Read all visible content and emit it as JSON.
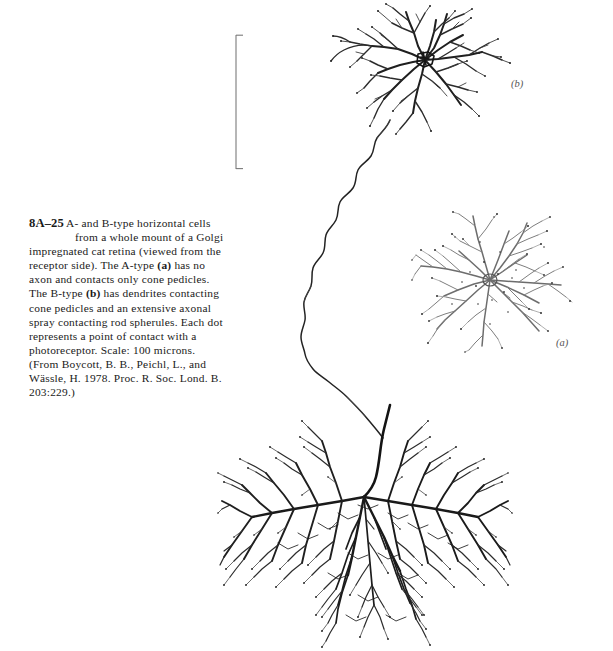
{
  "figure": {
    "number": "8A–25",
    "caption_line1": "A- and B-type horizontal cells",
    "caption_line2": "from a whole mount of a Golgi",
    "caption_rest_1": "impregnated cat retina (viewed from the receptor side). The A-type ",
    "caption_bold_a": "(a)",
    "caption_rest_2": " has no axon and contacts only cone pedicles. The B-type ",
    "caption_bold_b": "(b)",
    "caption_rest_3": " has dendrites contacting cone pedicles and an extensive axonal spray contacting rod spherules. Each dot represents a point of contact with a photoreceptor. Scale: 100 microns. (From Boycott, B. B., Peichl, L., and Wässle, H. 1978. Proc. R. Soc. Lond. B. 203:229.)",
    "full_caption": "8A–25 A- and B-type horizontal cells from a whole mount of a Golgi impregnated cat retina (viewed from the receptor side). The A-type (a) has no axon and contacts only cone pedicles. The B-type (b) has dendrites contacting cone pedicles and an extensive axonal spray contacting rod spherules. Each dot represents a point of contact with a photoreceptor. Scale: 100 microns. (From Boycott, B. B., Peichl, L., and Wässle, H. 1978. Proc. R. Soc. Lond. B. 203:229.)",
    "scale_value": "100 microns",
    "source": "Boycott, B. B., Peichl, L., and Wässle, H. 1978. Proc. R. Soc. Lond. B. 203:229."
  },
  "panels": {
    "a": {
      "label": "(a)",
      "description": "A-type horizontal cell dendritic field, no axon, contacts cone pedicles only"
    },
    "b": {
      "label": "(b)",
      "description": "B-type horizontal cell dendritic field with axon leading to axonal spray"
    }
  },
  "scalebar": {
    "orientation": "vertical",
    "length_px": 133,
    "represents": "100 microns",
    "color": "#777777"
  },
  "colors": {
    "background": "#ffffff",
    "ink_dark": "#1c1c1c",
    "ink_medium": "#4a4a4a",
    "ink_light": "#8d8d8d",
    "caption_text": "#1a1a1a",
    "label_text": "#555555"
  },
  "structures": {
    "dendritic_field_b": "dense dark radiating dendritic bush, top right",
    "axon": "long thin meandering axon descending from cell b soma",
    "axonal_spray": "large dense dark terminal axonal spray, bottom center",
    "dendritic_field_a": "lighter radiating dendritic tree with terminal contact dots, middle right"
  }
}
